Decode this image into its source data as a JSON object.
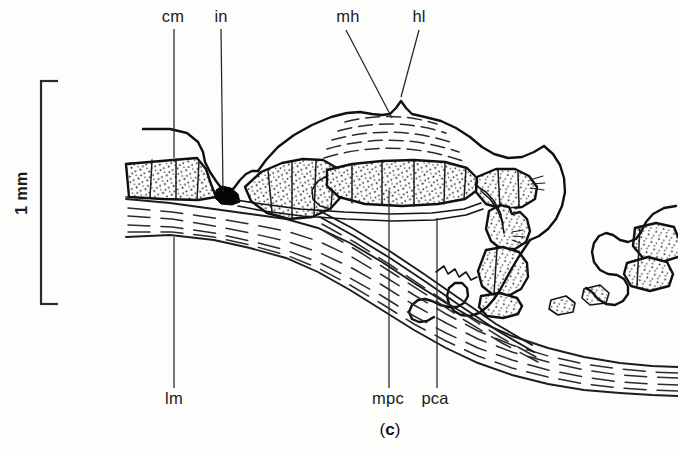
{
  "figure": {
    "caption": "(c)",
    "caption_letter": "c",
    "caption_open": "(",
    "caption_close": ")",
    "type": "anatomical-line-drawing",
    "ink_color": "#101010",
    "background_color": "#fdfdfc"
  },
  "scale_bar": {
    "label": "1 mm",
    "orientation": "vertical",
    "length_px": 225,
    "x_px": 41,
    "y_top_px": 80,
    "y_bottom_px": 305,
    "tick_length_px": 16
  },
  "labels": [
    {
      "id": "cm",
      "text": "cm",
      "name": "label-cm",
      "text_x": 173,
      "text_y": 22,
      "leader": "M 174 29 L 174 158",
      "position": "top"
    },
    {
      "id": "in",
      "text": "in",
      "name": "label-in",
      "text_x": 221,
      "text_y": 22,
      "leader": "M 221 29 L 222 192",
      "position": "top"
    },
    {
      "id": "mh",
      "text": "mh",
      "name": "label-mh",
      "text_x": 348,
      "text_y": 22,
      "leader": "M 346 30 L 392 118",
      "position": "top"
    },
    {
      "id": "hl",
      "text": "hl",
      "name": "label-hl",
      "text_x": 419,
      "text_y": 22,
      "leader": "M 419 30 L 401 97",
      "position": "top"
    },
    {
      "id": "lm",
      "text": "lm",
      "name": "label-lm",
      "text_x": 174,
      "text_y": 404,
      "leader": "M 174 237 L 174 388",
      "position": "bottom"
    },
    {
      "id": "mpc",
      "text": "mpc",
      "name": "label-mpc",
      "text_x": 388,
      "text_y": 404,
      "leader": "M 389 190 L 389 388",
      "position": "bottom"
    },
    {
      "id": "pca",
      "text": "pca",
      "name": "label-pca",
      "text_x": 435,
      "text_y": 404,
      "leader": "M 437 218 L 437 388",
      "position": "bottom"
    }
  ],
  "legend_keys": {
    "cm": "cm",
    "in": "in",
    "mh": "mh",
    "hl": "hl",
    "lm": "lm",
    "mpc": "mpc",
    "pca": "pca"
  }
}
